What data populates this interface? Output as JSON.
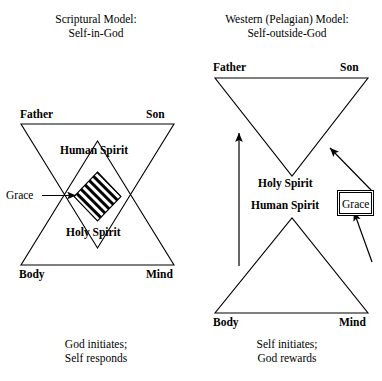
{
  "figure": {
    "background_color": "#ffffff",
    "ink_color": "#000000"
  },
  "left_panel": {
    "title": "Scriptural Model:\nSelf-in-God",
    "caption": "God initiates;\nSelf responds",
    "upper_triangle": {
      "name": "divine-triangle-inverted",
      "vertex_labels": {
        "top_left": "Father",
        "top_right": "Son",
        "interior": "Holy Spirit"
      }
    },
    "lower_triangle": {
      "name": "human-triangle-upright",
      "vertex_labels": {
        "bottom_left": "Body",
        "bottom_right": "Mind",
        "interior": "Human Spirit"
      }
    },
    "overlap_region": {
      "name": "grace-overlap-rhombus",
      "fill": "striped-black-white"
    },
    "grace_label": "Grace",
    "grace_arrow": {
      "direction": "right",
      "points_to": "grace-overlap-rhombus"
    }
  },
  "right_panel": {
    "title": "Western (Pelagian) Model:\nSelf-outside-God",
    "caption": "Self initiates;\nGod rewards",
    "upper_triangle": {
      "name": "divine-triangle-inverted",
      "vertex_labels": {
        "top_left": "Father",
        "top_right": "Son",
        "apex_below": "Holy Spirit"
      }
    },
    "lower_triangle": {
      "name": "human-triangle-upright",
      "vertex_labels": {
        "bottom_left": "Body",
        "bottom_right": "Mind",
        "apex_above": "Human Spirit"
      }
    },
    "grace_label": "Grace",
    "arrows": [
      {
        "name": "self-initiates-arrow",
        "direction": "up",
        "from": "Body",
        "to": "Father"
      },
      {
        "name": "grace-to-god-arrow",
        "direction": "up-left",
        "from": "Grace",
        "to": "Son"
      },
      {
        "name": "self-to-grace-arrow",
        "direction": "up-left",
        "from": "Mind",
        "to": "Grace"
      }
    ]
  }
}
